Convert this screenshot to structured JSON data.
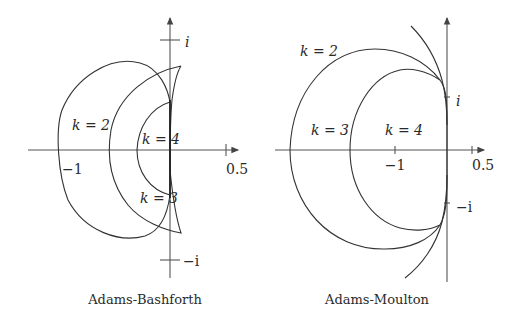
{
  "figure": {
    "left": {
      "caption": "Adams-Bashforth",
      "axis_labels": {
        "imag_pos": "i",
        "imag_neg": "−i",
        "real_neg": "−1",
        "real_pos": "0.5"
      },
      "curve_labels": {
        "k2": "k = 2",
        "k3": "k = 3",
        "k4": "k = 4"
      }
    },
    "right": {
      "caption": "Adams-Moulton",
      "axis_labels": {
        "imag_pos": "i",
        "imag_neg": "−i",
        "real_neg": "−1",
        "real_pos": "0.5"
      },
      "curve_labels": {
        "k2": "k = 2",
        "k3": "k = 3",
        "k4": "k = 4"
      }
    }
  }
}
